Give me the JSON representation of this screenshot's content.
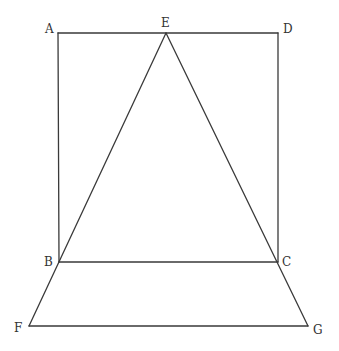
{
  "diagram": {
    "type": "geometry",
    "points": {
      "A": {
        "x": 58,
        "y": 33,
        "label": "A",
        "lx": 45,
        "ly": 33
      },
      "E": {
        "x": 166,
        "y": 33,
        "label": "E",
        "lx": 161,
        "ly": 27
      },
      "D": {
        "x": 278,
        "y": 33,
        "label": "D",
        "lx": 283,
        "ly": 33
      },
      "B": {
        "x": 59,
        "y": 262,
        "label": "B",
        "lx": 44,
        "ly": 266
      },
      "C": {
        "x": 278,
        "y": 262,
        "label": "C",
        "lx": 282,
        "ly": 266
      },
      "F": {
        "x": 29,
        "y": 326,
        "label": "F",
        "lx": 14,
        "ly": 332
      },
      "G": {
        "x": 308,
        "y": 326,
        "label": "G",
        "lx": 313,
        "ly": 334
      }
    },
    "segments": [
      [
        "A",
        "D"
      ],
      [
        "A",
        "B"
      ],
      [
        "D",
        "C"
      ],
      [
        "B",
        "C"
      ],
      [
        "E",
        "F"
      ],
      [
        "E",
        "G"
      ],
      [
        "F",
        "G"
      ]
    ],
    "line_color": "#3a3a3a",
    "label_color": "#333333"
  }
}
